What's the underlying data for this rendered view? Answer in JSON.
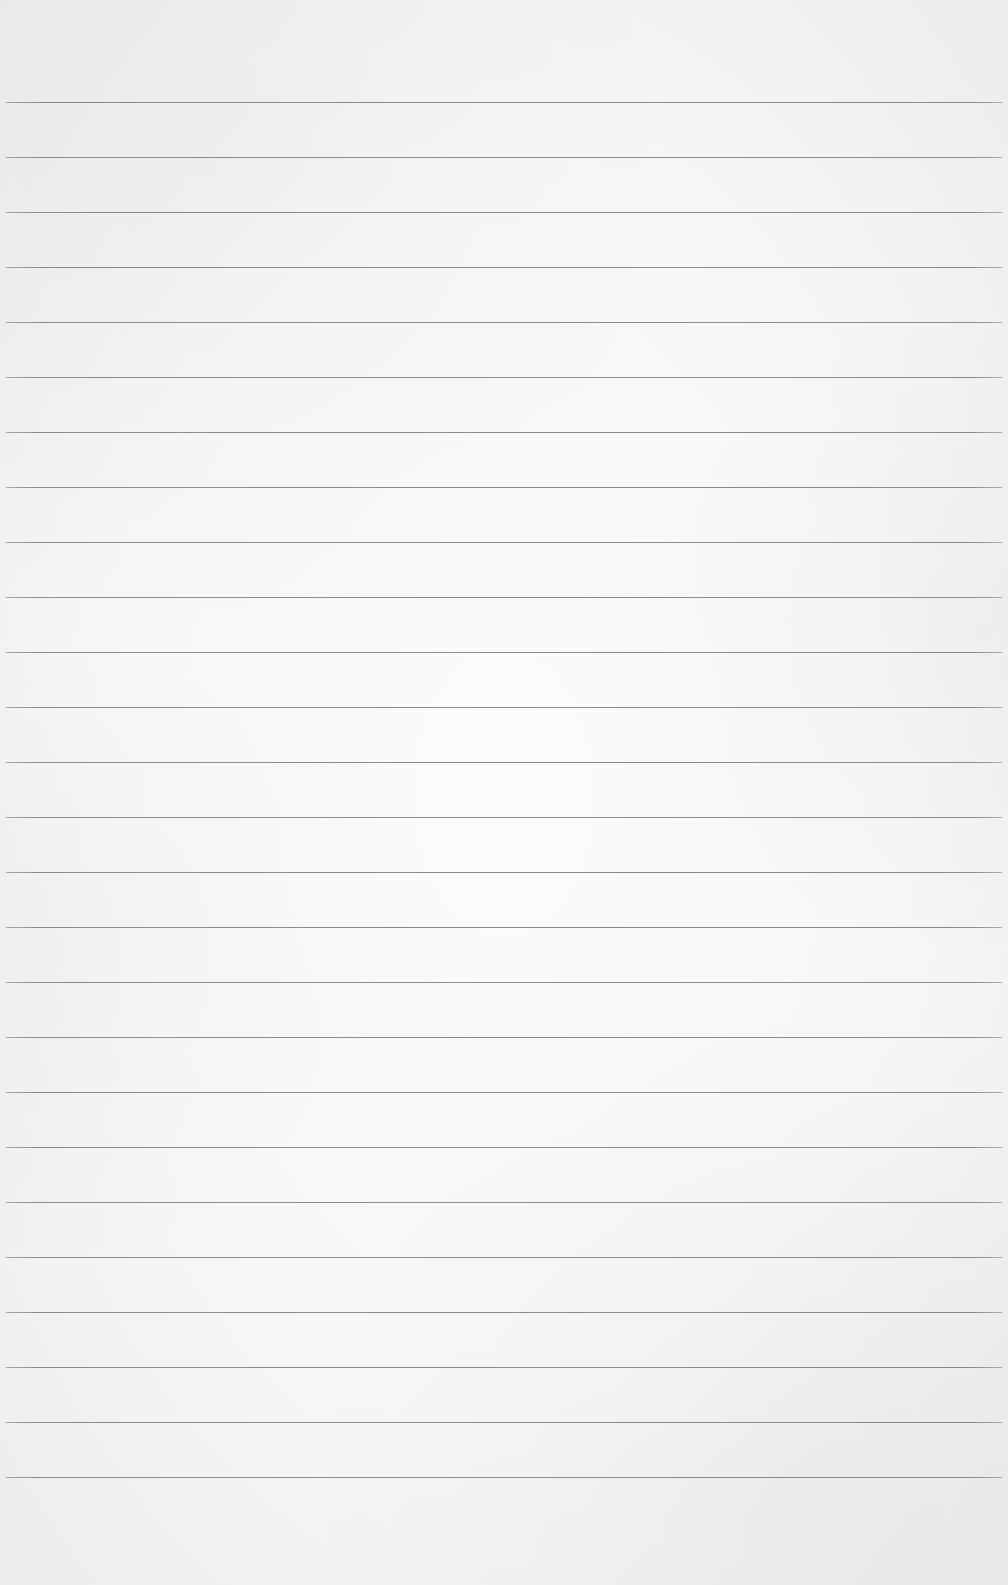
{
  "paper": {
    "background": "#f7f7f6",
    "line_color": "#8a8a8a",
    "first_line_y": 102,
    "line_spacing": 55,
    "line_count": 26,
    "line_left": 6,
    "line_right": 1002
  }
}
